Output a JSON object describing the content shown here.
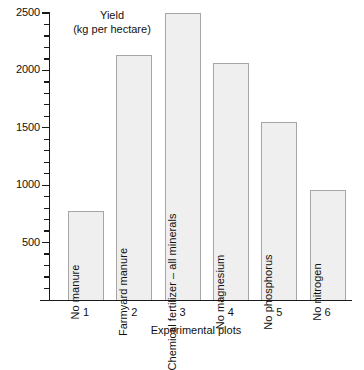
{
  "chart_data": {
    "type": "bar",
    "title": "Yield",
    "subtitle": "(kg per hectare)",
    "xlabel": "Experimental plots",
    "ylabel": "",
    "ylim": [
      0,
      2500
    ],
    "grid": false,
    "legend": "none",
    "y_major_step": 500,
    "y_minor_step": 100,
    "categories": [
      "1",
      "2",
      "3",
      "4",
      "5",
      "6"
    ],
    "bar_labels": [
      "No manure",
      "Farmyard manure",
      "Chemical fertilizer – all minerals",
      "No magnesium",
      "No phosphorus",
      "No nitrogen"
    ],
    "values": [
      775,
      2135,
      2500,
      2065,
      1550,
      955
    ],
    "y_tick_labels": [
      "500",
      "1000",
      "1500",
      "2000",
      "2500"
    ],
    "y_tick_values": [
      500,
      1000,
      1500,
      2000,
      2500
    ],
    "colors": {
      "bar_fill": "#efefef",
      "bar_border": "#a6a6a6",
      "axis": "#1a1a1a",
      "text": "#111111",
      "background": "#ffffff"
    }
  }
}
